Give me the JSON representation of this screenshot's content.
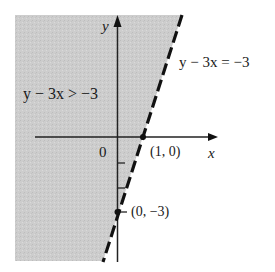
{
  "diagram": {
    "inequality_label": "y − 3x > −3",
    "boundary_label": "y − 3x = −3",
    "boundary_style": "dashed",
    "shaded_side": "left/above the line",
    "axes": {
      "x_label": "x",
      "y_label": "y",
      "origin_label": "0"
    },
    "points": [
      {
        "label": "(1, 0)",
        "x": 1,
        "y": 0
      },
      {
        "label": "(0, −3)",
        "x": 0,
        "y": -3
      }
    ],
    "colors": {
      "shade": "#cfcfcf",
      "line": "#111111",
      "axis": "#222222",
      "text": "#1a1a1a"
    }
  }
}
